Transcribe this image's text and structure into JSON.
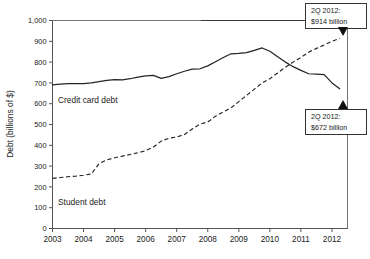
{
  "chart_data": {
    "type": "line",
    "title": "",
    "subtitle": "",
    "xlabel": "",
    "ylabel": "Debt (billions of $)",
    "xlim": [
      2003.0,
      2012.5
    ],
    "ylim": [
      0,
      1000
    ],
    "grid": false,
    "legend_position": "inline-labels",
    "xticks": [
      "2003",
      "2004",
      "2005",
      "2006",
      "2007",
      "2008",
      "2009",
      "2010",
      "2011",
      "2012"
    ],
    "xtick_values": [
      2003,
      2004,
      2005,
      2006,
      2007,
      2008,
      2009,
      2010,
      2011,
      2012
    ],
    "yticks": [
      "0",
      "100",
      "200",
      "300",
      "400",
      "500",
      "600",
      "700",
      "800",
      "900",
      "1,000"
    ],
    "ytick_values": [
      0,
      100,
      200,
      300,
      400,
      500,
      600,
      700,
      800,
      900,
      1000
    ],
    "series": [
      {
        "name": "Credit card debt",
        "style": "solid",
        "color": "#242424",
        "inline_label": "Credit card debt",
        "x": [
          2003.0,
          2003.25,
          2003.5,
          2003.75,
          2004.0,
          2004.25,
          2004.5,
          2004.75,
          2005.0,
          2005.25,
          2005.5,
          2005.75,
          2006.0,
          2006.25,
          2006.5,
          2006.75,
          2007.0,
          2007.25,
          2007.5,
          2007.75,
          2008.0,
          2008.25,
          2008.5,
          2008.75,
          2009.0,
          2009.25,
          2009.5,
          2009.75,
          2010.0,
          2010.25,
          2010.5,
          2010.75,
          2011.0,
          2011.25,
          2011.5,
          2011.75,
          2012.0,
          2012.25
        ],
        "values": [
          690,
          694,
          697,
          697,
          697,
          700,
          706,
          712,
          716,
          714,
          720,
          728,
          734,
          736,
          722,
          730,
          744,
          756,
          766,
          768,
          782,
          802,
          822,
          840,
          842,
          846,
          856,
          868,
          852,
          826,
          800,
          778,
          760,
          744,
          742,
          740,
          700,
          672
        ],
        "endpoint_value": 672
      },
      {
        "name": "Student debt",
        "style": "dashed",
        "color": "#242424",
        "inline_label": "Student debt",
        "x": [
          2003.0,
          2003.25,
          2003.5,
          2003.75,
          2004.0,
          2004.25,
          2004.5,
          2004.75,
          2005.0,
          2005.25,
          2005.5,
          2005.75,
          2006.0,
          2006.25,
          2006.5,
          2006.75,
          2007.0,
          2007.25,
          2007.5,
          2007.75,
          2008.0,
          2008.25,
          2008.5,
          2008.75,
          2009.0,
          2009.25,
          2009.5,
          2009.75,
          2010.0,
          2010.25,
          2010.5,
          2010.75,
          2011.0,
          2011.25,
          2011.5,
          2011.75,
          2012.0,
          2012.25
        ],
        "values": [
          241,
          245,
          249,
          252,
          256,
          262,
          312,
          330,
          340,
          348,
          356,
          364,
          374,
          392,
          420,
          434,
          440,
          452,
          478,
          502,
          512,
          540,
          560,
          580,
          610,
          640,
          670,
          700,
          720,
          748,
          775,
          800,
          822,
          848,
          866,
          882,
          900,
          914
        ],
        "endpoint_value": 914
      }
    ],
    "annotations": [
      {
        "id": "student-debt-callout",
        "line1": "2Q 2012:",
        "line2": "$914 billion",
        "points_to_series": "Student debt",
        "marker": "triangle-down"
      },
      {
        "id": "credit-card-debt-callout",
        "line1": "2Q 2012:",
        "line2": "$672 billion",
        "points_to_series": "Credit card debt",
        "marker": "triangle-up"
      }
    ]
  }
}
